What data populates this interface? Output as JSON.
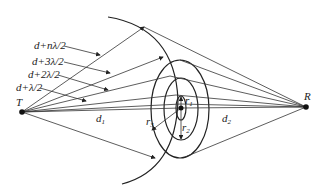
{
  "diagram": {
    "type": "fresnel-zone-diagram",
    "transmitter_label": "T",
    "receiver_label": "R",
    "path_labels": [
      "d+nλ/2",
      "d+3λ/2",
      "d+2λ/2",
      "d+λ/2"
    ],
    "distance_labels": {
      "d1": "d",
      "d1_sub": "1",
      "d2": "d",
      "d2_sub": "2"
    },
    "radius_labels": {
      "r1": "r",
      "r1_sub": "1",
      "r2": "r",
      "r2_sub": "2",
      "r3": "r",
      "r3_sub": "3"
    },
    "colors": {
      "line": "#333333",
      "background": "#ffffff"
    }
  }
}
